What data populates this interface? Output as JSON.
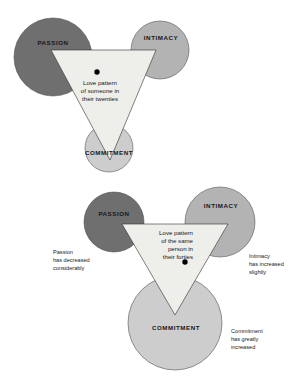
{
  "figure": {
    "palette": {
      "passion_fill": "#6f6f6f",
      "intimacy_fill": "#b3b3b3",
      "commitment_fill": "#cdcdcd",
      "triangle_fill": "#eeeeea",
      "outline": "#4a4a4a",
      "triangle_outline": "#2e2e2e",
      "dot": "#000000",
      "background": "#ffffff"
    },
    "diagrams": [
      {
        "id": "twenties",
        "circles": [
          {
            "key": "passion",
            "label": "PASSION"
          },
          {
            "key": "intimacy",
            "label": "INTIMACY"
          },
          {
            "key": "commitment",
            "label": "COMMITMENT"
          }
        ],
        "triangle_caption": {
          "lines": [
            "Love pattern",
            "of someone in",
            "their twenties"
          ]
        },
        "dot_label": "love-pattern-point",
        "notes": []
      },
      {
        "id": "forties",
        "circles": [
          {
            "key": "passion",
            "label": "PASSION"
          },
          {
            "key": "intimacy",
            "label": "INTIMACY"
          },
          {
            "key": "commitment",
            "label": "COMMITMENT"
          }
        ],
        "triangle_caption": {
          "lines": [
            "Love pattern",
            "of the same",
            "person in",
            "their forties"
          ]
        },
        "dot_label": "love-pattern-point",
        "notes": [
          {
            "key": "passion-note",
            "lines": [
              "Passion",
              "has decreased",
              "considerably"
            ]
          },
          {
            "key": "intimacy-note",
            "lines": [
              "Intimacy",
              "has increased",
              "slightly"
            ]
          },
          {
            "key": "commitment-note",
            "lines": [
              "Commitment",
              "has greatly",
              "increased"
            ]
          }
        ]
      }
    ]
  }
}
